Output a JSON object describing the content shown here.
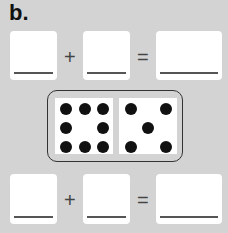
{
  "label": "b.",
  "equations": [
    {
      "operand1": "",
      "plus": "+",
      "operand2": "",
      "equals": "=",
      "result": ""
    },
    {
      "operand1": "",
      "plus": "+",
      "operand2": "",
      "equals": "=",
      "result": ""
    }
  ],
  "domino": {
    "left_dots": 8,
    "right_dots": 5
  }
}
